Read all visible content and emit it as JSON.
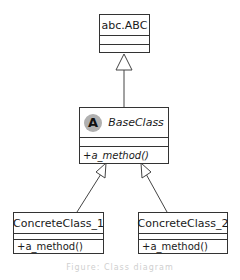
{
  "diagram": {
    "type": "uml-class-diagram",
    "classes": [
      {
        "id": "abc_ABC",
        "name": "abc.ABC",
        "abstract": false,
        "attributes": [],
        "methods": []
      },
      {
        "id": "BaseClass",
        "name": "BaseClass",
        "abstract": true,
        "badge": "A",
        "attributes": [],
        "methods": [
          "+a_method()"
        ]
      },
      {
        "id": "ConcreteClass_1",
        "name": "ConcreteClass_1",
        "abstract": false,
        "attributes": [],
        "methods": [
          "+a_method()"
        ]
      },
      {
        "id": "ConcreteClass_2",
        "name": "ConcreteClass_2",
        "abstract": false,
        "attributes": [],
        "methods": [
          "+a_method()"
        ]
      }
    ],
    "relations": [
      {
        "type": "generalization",
        "from": "BaseClass",
        "to": "abc_ABC"
      },
      {
        "type": "generalization",
        "from": "ConcreteClass_1",
        "to": "BaseClass"
      },
      {
        "type": "generalization",
        "from": "ConcreteClass_2",
        "to": "BaseClass"
      }
    ],
    "caption": "Figure: Class diagram"
  },
  "colors": {
    "stroke": "#333333",
    "badge": "#b0b0b0",
    "background": "#ffffff"
  }
}
